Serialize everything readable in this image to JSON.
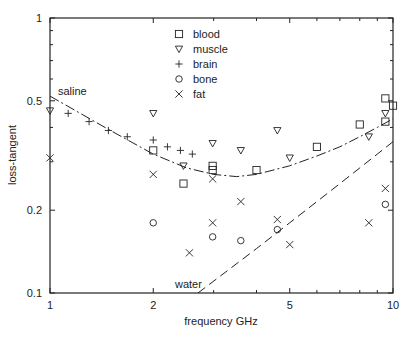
{
  "chart_data": {
    "type": "scatter",
    "title": "",
    "xlabel": "frequency GHz",
    "ylabel": "loss-tangent",
    "xscale": "log",
    "yscale": "log",
    "xlim": [
      1,
      10
    ],
    "ylim": [
      0.1,
      1
    ],
    "x_ticks": [
      1,
      2,
      5,
      10
    ],
    "x_tick_labels": [
      "1",
      "2",
      "5",
      "10"
    ],
    "y_ticks": [
      0.1,
      0.2,
      0.5,
      1
    ],
    "y_tick_labels": [
      "0.1",
      "0.2",
      "0.5",
      "1"
    ],
    "grid": false,
    "legend_position": "upper center",
    "series": [
      {
        "name": "blood",
        "marker": "square",
        "points": [
          [
            2.0,
            0.33
          ],
          [
            2.45,
            0.25
          ],
          [
            2.98,
            0.29
          ],
          [
            2.98,
            0.28
          ],
          [
            4.0,
            0.28
          ],
          [
            6.0,
            0.34
          ],
          [
            8.0,
            0.41
          ],
          [
            9.5,
            0.51
          ],
          [
            9.5,
            0.42
          ],
          [
            10.0,
            0.48
          ]
        ]
      },
      {
        "name": "muscle",
        "marker": "triangle-down",
        "points": [
          [
            1.0,
            0.46
          ],
          [
            2.0,
            0.45
          ],
          [
            2.45,
            0.29
          ],
          [
            2.98,
            0.35
          ],
          [
            3.6,
            0.33
          ],
          [
            4.6,
            0.39
          ],
          [
            5.0,
            0.31
          ],
          [
            8.5,
            0.37
          ],
          [
            9.5,
            0.45
          ]
        ]
      },
      {
        "name": "brain",
        "marker": "plus",
        "points": [
          [
            1.13,
            0.45
          ],
          [
            1.3,
            0.42
          ],
          [
            1.48,
            0.39
          ],
          [
            1.68,
            0.37
          ],
          [
            2.0,
            0.36
          ],
          [
            2.2,
            0.34
          ],
          [
            2.4,
            0.33
          ],
          [
            2.6,
            0.32
          ]
        ]
      },
      {
        "name": "bone",
        "marker": "circle",
        "points": [
          [
            2.0,
            0.18
          ],
          [
            2.98,
            0.16
          ],
          [
            3.6,
            0.155
          ],
          [
            4.6,
            0.17
          ],
          [
            9.5,
            0.21
          ]
        ]
      },
      {
        "name": "fat",
        "marker": "x",
        "points": [
          [
            1.0,
            0.31
          ],
          [
            2.0,
            0.27
          ],
          [
            2.55,
            0.14
          ],
          [
            2.98,
            0.26
          ],
          [
            2.98,
            0.18
          ],
          [
            3.6,
            0.215
          ],
          [
            4.6,
            0.185
          ],
          [
            5.0,
            0.15
          ],
          [
            8.5,
            0.18
          ],
          [
            9.5,
            0.24
          ]
        ]
      }
    ],
    "curves": [
      {
        "name": "saline",
        "style": "dash-dot",
        "points": [
          [
            1.0,
            0.52
          ],
          [
            1.5,
            0.39
          ],
          [
            2.0,
            0.32
          ],
          [
            2.5,
            0.285
          ],
          [
            3.0,
            0.27
          ],
          [
            3.5,
            0.265
          ],
          [
            4.0,
            0.27
          ],
          [
            5.0,
            0.29
          ],
          [
            6.0,
            0.315
          ],
          [
            7.0,
            0.34
          ],
          [
            8.0,
            0.37
          ],
          [
            9.0,
            0.4
          ],
          [
            10.0,
            0.43
          ]
        ]
      },
      {
        "name": "water",
        "style": "dashed",
        "points": [
          [
            2.7,
            0.1
          ],
          [
            4.0,
            0.145
          ],
          [
            5.0,
            0.18
          ],
          [
            6.0,
            0.215
          ],
          [
            7.0,
            0.25
          ],
          [
            8.0,
            0.285
          ],
          [
            9.0,
            0.32
          ],
          [
            10.0,
            0.355
          ]
        ]
      }
    ],
    "annotations": [
      {
        "text": "saline",
        "x": 1.05,
        "y": 0.56
      },
      {
        "text": "water",
        "x": 2.05,
        "y": 0.105
      }
    ]
  },
  "legend": {
    "items": [
      {
        "label": "blood",
        "marker": "square"
      },
      {
        "label": "muscle",
        "marker": "triangle-down"
      },
      {
        "label": "brain",
        "marker": "plus"
      },
      {
        "label": "bone",
        "marker": "circle"
      },
      {
        "label": "fat",
        "marker": "x"
      }
    ]
  },
  "axes": {
    "xlabel": "frequency GHz",
    "ylabel": "loss-tangent",
    "x_tick_labels": [
      "1",
      "2",
      "5",
      "10"
    ],
    "y_tick_labels": [
      "0.1",
      "0.2",
      "0.5",
      "1"
    ]
  },
  "labels": {
    "saline": "saline",
    "water": "water"
  },
  "colors": {
    "ink": "#222222",
    "background": "#ffffff"
  }
}
